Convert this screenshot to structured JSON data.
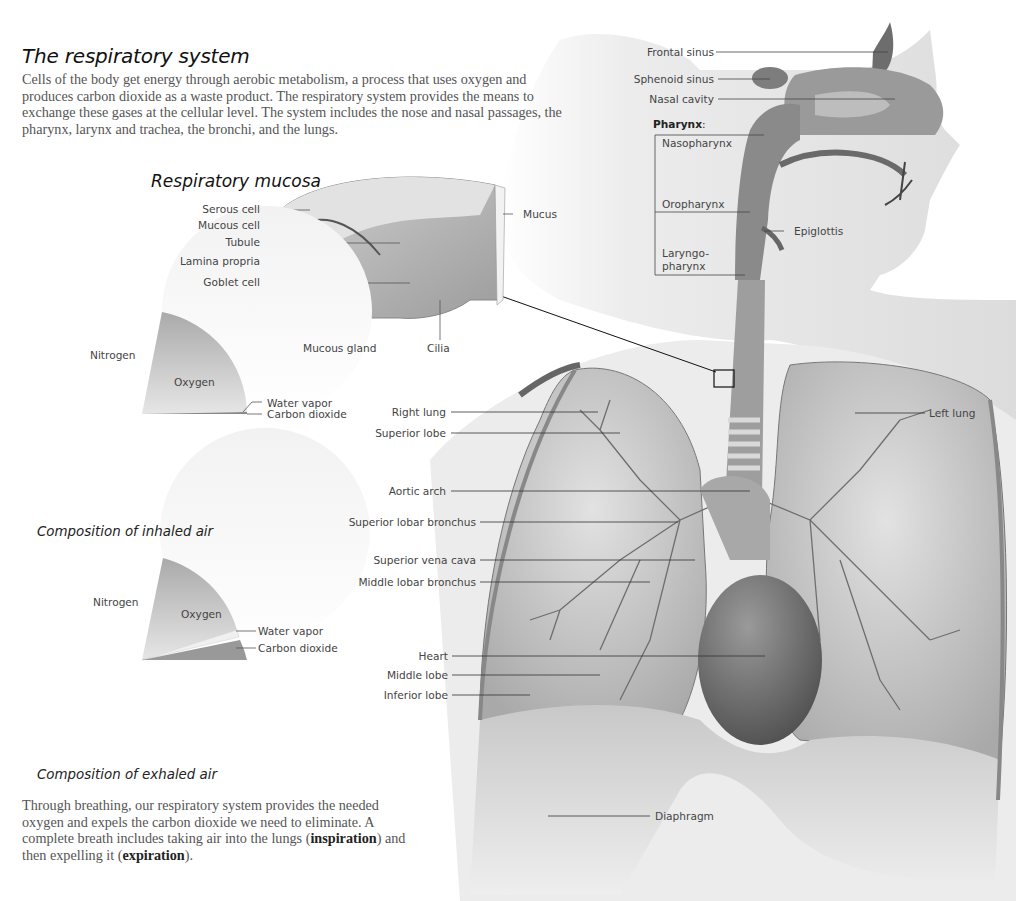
{
  "header": {
    "title": "The respiratory system",
    "intro": "Cells of the body get energy through aerobic metabolism, a process that uses oxygen and produces carbon dioxide as a waste product. The respiratory system provides the means to exchange these gases at the cellular level. The system includes the nose and nasal passages, the pharynx, larynx and trachea, the bronchi, and the lungs."
  },
  "mucosa": {
    "title": "Respiratory mucosa",
    "labels": {
      "serous_cell": "Serous cell",
      "mucous_cell": "Mucous cell",
      "tubule": "Tubule",
      "lamina_propria": "Lamina propria",
      "goblet_cell": "Goblet cell",
      "mucous_gland": "Mucous gland",
      "cilia": "Cilia",
      "mucus": "Mucus"
    }
  },
  "inhaled": {
    "caption": "Composition of inhaled air",
    "labels": {
      "nitrogen": "Nitrogen",
      "oxygen": "Oxygen",
      "water_vapor": "Water vapor",
      "carbon_dioxide": "Carbon dioxide"
    }
  },
  "exhaled": {
    "caption": "Composition of exhaled air",
    "labels": {
      "nitrogen": "Nitrogen",
      "oxygen": "Oxygen",
      "water_vapor": "Water vapor",
      "carbon_dioxide": "Carbon dioxide"
    }
  },
  "outro": {
    "text_1": "Through breathing, our respiratory system provides the needed oxygen and expels the carbon dioxide we need to eliminate. A complete breath includes taking air into the lungs (",
    "bold_1": "inspiration",
    "text_2": ") and then expelling it (",
    "bold_2": "expiration",
    "text_3": ")."
  },
  "head": {
    "labels": {
      "frontal_sinus": "Frontal sinus",
      "sphenoid_sinus": "Sphenoid sinus",
      "nasal_cavity": "Nasal cavity",
      "pharynx": "Pharynx",
      "pharynx_colon": ":",
      "nasopharynx": "Nasopharynx",
      "oropharynx": "Oropharynx",
      "laryngo_1": "Laryngo-",
      "laryngo_2": "pharynx",
      "epiglottis": "Epiglottis"
    }
  },
  "thorax": {
    "labels": {
      "right_lung": "Right lung",
      "superior_lobe": "Superior lobe",
      "aortic_arch": "Aortic arch",
      "superior_lobar_bronchus": "Superior lobar bronchus",
      "superior_vena_cava": "Superior vena cava",
      "middle_lobar_bronchus": "Middle lobar bronchus",
      "heart": "Heart",
      "middle_lobe": "Middle lobe",
      "inferior_lobe": "Inferior lobe",
      "left_lung": "Left lung",
      "diaphragm": "Diaphragm"
    }
  },
  "colors": {
    "silhouette": "#e4e4e4",
    "tissue_dark": "#8a8a8a",
    "tissue_mid": "#b5b5b5",
    "tissue_light": "#d6d6d6",
    "leader_line": "#444444"
  }
}
